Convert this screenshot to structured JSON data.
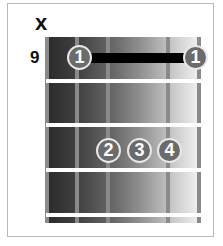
{
  "chord_diagram": {
    "muted_string_marker": "x",
    "start_fret": "9",
    "strings": 6,
    "frets_shown": 4,
    "barre": {
      "finger": "1",
      "fret": 1,
      "from_string": 2,
      "to_string": 6
    },
    "fingers": [
      {
        "label": "1",
        "string": 2,
        "fret": 1
      },
      {
        "label": "1",
        "string": 6,
        "fret": 1
      },
      {
        "label": "2",
        "string": 3,
        "fret": 3
      },
      {
        "label": "3",
        "string": 4,
        "fret": 3
      },
      {
        "label": "4",
        "string": 5,
        "fret": 3
      }
    ],
    "colors": {
      "dot": "#6b6b6b",
      "dot_border": "#e8e8e8",
      "barre": "#000000",
      "fret": "#ffffff",
      "string": "#8a8a8a"
    }
  }
}
